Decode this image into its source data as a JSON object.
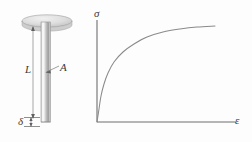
{
  "figure": {
    "background_color": "#fdfdfd",
    "ink_color": "#6e6e6e",
    "text_color": "#3a3a3a"
  },
  "specimen": {
    "name": "axially-loaded-bar",
    "cap": {
      "name": "bar-top-cap",
      "shape": "ellipse",
      "center_x": 47,
      "center_y": 21,
      "radius_x": 25,
      "radius_y": 6,
      "fill": "#dcdcdc"
    },
    "rod": {
      "name": "bar-shaft",
      "x": 41,
      "y": 21,
      "width": 9,
      "height": 101,
      "fill_light": "#f2f2f2",
      "fill_dark": "#b9b9b9"
    },
    "labels": {
      "length": "L",
      "area": "A",
      "elongation": "δ"
    }
  },
  "chart_data": {
    "type": "line",
    "title": "",
    "xlabel": "ε",
    "ylabel": "σ",
    "xlim": [
      0,
      1
    ],
    "ylim": [
      0,
      1
    ],
    "grid": false,
    "legend": false,
    "axis_origin_px": [
      97,
      122
    ],
    "axis_x_end_px": [
      236,
      122
    ],
    "axis_y_end_px": [
      97,
      20
    ],
    "series": [
      {
        "name": "stress-strain",
        "description": "monotonic concave-down stress-strain curve rising steeply then flattening",
        "x": [
          0.0,
          0.03,
          0.07,
          0.12,
          0.18,
          0.26,
          0.35,
          0.46,
          0.58,
          0.7,
          0.82,
          0.92,
          1.0
        ],
        "y": [
          0.0,
          0.13,
          0.26,
          0.38,
          0.49,
          0.6,
          0.7,
          0.78,
          0.85,
          0.9,
          0.93,
          0.95,
          0.96
        ],
        "points_px": [
          [
            97,
            122
          ],
          [
            99,
            109
          ],
          [
            101,
            96
          ],
          [
            104,
            84
          ],
          [
            108,
            73
          ],
          [
            114,
            62
          ],
          [
            123,
            52
          ],
          [
            134,
            44
          ],
          [
            147,
            37
          ],
          [
            163,
            32
          ],
          [
            180,
            29
          ],
          [
            197,
            27
          ],
          [
            215,
            26
          ]
        ],
        "color": "#8a8a8a"
      }
    ]
  }
}
